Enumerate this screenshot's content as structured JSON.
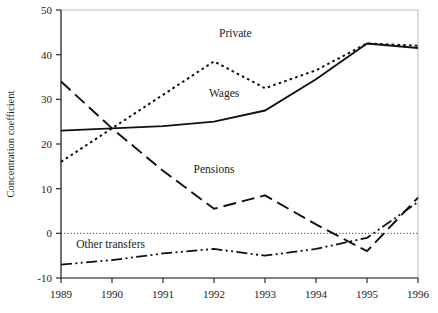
{
  "chart_data": {
    "type": "line",
    "title": "",
    "xlabel": "",
    "ylabel": "Concentration coefficient",
    "x": [
      1989,
      1990,
      1991,
      1992,
      1993,
      1994,
      1995,
      1996
    ],
    "xtick_labels": [
      "1989",
      "1990",
      "1991",
      "1992",
      "1993",
      "1994",
      "1995",
      "1996"
    ],
    "ytick_labels": [
      "-10",
      "0",
      "10",
      "20",
      "30",
      "40",
      "50"
    ],
    "ytick_values": [
      -10,
      0,
      10,
      20,
      30,
      40,
      50
    ],
    "xlim": [
      1989,
      1996
    ],
    "ylim": [
      -10,
      50
    ],
    "grid": false,
    "zero_line": true,
    "legend_position": "inline-annotations",
    "series": [
      {
        "name": "Private",
        "style": "dotted",
        "label_x": 1992.1,
        "label_y": 44.0,
        "values": [
          16.0,
          23.5,
          31.0,
          38.5,
          32.5,
          36.5,
          42.5,
          42.0
        ]
      },
      {
        "name": "Wages",
        "style": "solid",
        "label_x": 1991.9,
        "label_y": 30.5,
        "values": [
          23.0,
          23.5,
          24.0,
          25.0,
          27.5,
          34.5,
          42.5,
          41.5
        ]
      },
      {
        "name": "Pensions",
        "style": "dashed",
        "label_x": 1991.6,
        "label_y": 13.5,
        "values": [
          34.0,
          23.5,
          14.0,
          5.5,
          8.5,
          2.0,
          -4.0,
          8.0
        ]
      },
      {
        "name": "Other transfers",
        "style": "dashdotdot",
        "label_x": 1989.3,
        "label_y": -3.2,
        "values": [
          -7.0,
          -6.0,
          -4.5,
          -3.5,
          -5.0,
          -3.5,
          -1.0,
          7.0
        ]
      }
    ]
  }
}
